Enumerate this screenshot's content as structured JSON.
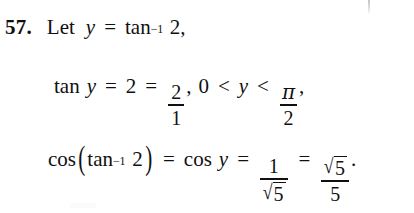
{
  "document": {
    "type": "textbook-solution",
    "background_color": "#ffffff",
    "text_color": "#101010",
    "problem_number": "57.",
    "lines": [
      {
        "id": "line-1",
        "plain_text": "57. Let y = tan⁻¹ 2,",
        "tokens": {
          "let": "Let",
          "variable_y": "y",
          "equals": "=",
          "function_tan": "tan",
          "exponent_inverse": "−1",
          "argument": "2",
          "comma": ","
        }
      },
      {
        "id": "line-2",
        "plain_text": "tan y = 2 = 2/1, 0 < y < π/2,",
        "tokens": {
          "function_tan": "tan",
          "variable_y": "y",
          "equals_1": "=",
          "value_2": "2",
          "equals_2": "=",
          "fraction_numerator": "2",
          "fraction_denominator": "1",
          "comma_1": ",",
          "zero": "0",
          "less_than_1": "<",
          "variable_y2": "y",
          "less_than_2": "<",
          "pi_numerator": "π",
          "pi_denominator": "2",
          "comma_2": ","
        }
      },
      {
        "id": "line-3",
        "plain_text": "cos(tan⁻¹ 2) = cos y = 1/√5 = √5/5.",
        "tokens": {
          "function_cos_1": "cos",
          "paren_open": "(",
          "function_tan": "tan",
          "exponent_inverse": "−1",
          "argument": "2",
          "paren_close": ")",
          "equals_1": "=",
          "function_cos_2": "cos",
          "variable_y": "y",
          "equals_2": "=",
          "frac1_numerator": "1",
          "frac1_denominator_radicand": "5",
          "radical_sign": "√",
          "equals_3": "=",
          "frac2_numerator_radicand": "5",
          "frac2_denominator": "5",
          "period": "."
        }
      }
    ]
  }
}
